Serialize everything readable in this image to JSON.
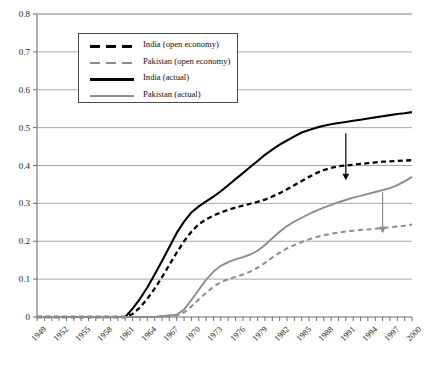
{
  "chart_data": {
    "type": "line",
    "title": "",
    "xlabel": "",
    "ylabel": "",
    "xlim": [
      1949,
      2000
    ],
    "ylim": [
      0,
      0.8
    ],
    "grid": "horizontal",
    "legend_position": "top-left",
    "ytick_labels": [
      "0",
      "0.1",
      "0.2",
      "0.3",
      "0.4",
      "0.5",
      "0.6",
      "0.7",
      "0.8"
    ],
    "ytick_values": [
      0,
      0.1,
      0.2,
      0.3,
      0.4,
      0.5,
      0.6,
      0.7,
      0.8
    ],
    "xtick_labels": [
      "1949",
      "1952",
      "1955",
      "1958",
      "1961",
      "1964",
      "1967",
      "1970",
      "1973",
      "1976",
      "1979",
      "1982",
      "1985",
      "1988",
      "1991",
      "1994",
      "1997",
      "2000"
    ],
    "xtick_values": [
      1949,
      1952,
      1955,
      1958,
      1961,
      1964,
      1967,
      1970,
      1973,
      1976,
      1979,
      1982,
      1985,
      1988,
      1991,
      1994,
      1997,
      2000
    ],
    "x": [
      1949,
      1950,
      1951,
      1952,
      1953,
      1954,
      1955,
      1956,
      1957,
      1958,
      1959,
      1960,
      1961,
      1962,
      1963,
      1964,
      1965,
      1966,
      1967,
      1968,
      1969,
      1970,
      1971,
      1972,
      1973,
      1974,
      1975,
      1976,
      1977,
      1978,
      1979,
      1980,
      1981,
      1982,
      1983,
      1984,
      1985,
      1986,
      1987,
      1988,
      1989,
      1990,
      1991,
      1992,
      1993,
      1994,
      1995,
      1996,
      1997,
      1998,
      1999,
      2000
    ],
    "series": [
      {
        "name": "India (actual)",
        "style": "solid",
        "color": "#000000",
        "values": [
          0,
          0,
          0,
          0,
          0,
          0,
          0,
          0,
          0,
          0,
          0,
          0,
          0,
          0.022,
          0.048,
          0.078,
          0.112,
          0.148,
          0.185,
          0.222,
          0.252,
          0.276,
          0.292,
          0.305,
          0.318,
          0.332,
          0.348,
          0.364,
          0.38,
          0.396,
          0.412,
          0.428,
          0.442,
          0.455,
          0.466,
          0.477,
          0.487,
          0.494,
          0.5,
          0.505,
          0.509,
          0.512,
          0.515,
          0.518,
          0.521,
          0.524,
          0.527,
          0.53,
          0.533,
          0.536,
          0.538,
          0.541
        ]
      },
      {
        "name": "India (open economy)",
        "style": "dashed",
        "color": "#000000",
        "values": [
          0,
          0,
          0,
          0,
          0,
          0,
          0,
          0,
          0,
          0,
          0,
          0,
          0,
          0.008,
          0.025,
          0.048,
          0.075,
          0.105,
          0.138,
          0.17,
          0.2,
          0.225,
          0.245,
          0.258,
          0.268,
          0.276,
          0.283,
          0.289,
          0.294,
          0.299,
          0.304,
          0.31,
          0.318,
          0.327,
          0.337,
          0.348,
          0.359,
          0.37,
          0.38,
          0.388,
          0.394,
          0.398,
          0.4,
          0.402,
          0.404,
          0.406,
          0.408,
          0.41,
          0.411,
          0.412,
          0.413,
          0.414
        ]
      },
      {
        "name": "Pakistan (actual)",
        "style": "solid",
        "color": "#8c8c8c",
        "values": [
          0,
          0,
          0,
          0,
          0,
          0,
          0,
          0,
          0,
          0,
          0,
          0,
          0,
          0,
          0,
          0,
          0,
          0.002,
          0.004,
          0.006,
          0.02,
          0.045,
          0.072,
          0.098,
          0.12,
          0.135,
          0.145,
          0.152,
          0.158,
          0.165,
          0.175,
          0.19,
          0.208,
          0.225,
          0.24,
          0.252,
          0.262,
          0.272,
          0.281,
          0.289,
          0.296,
          0.303,
          0.309,
          0.315,
          0.32,
          0.325,
          0.33,
          0.335,
          0.34,
          0.348,
          0.358,
          0.37
        ]
      },
      {
        "name": "Pakistan (open economy)",
        "style": "dashed",
        "color": "#8c8c8c",
        "values": [
          0,
          0,
          0,
          0,
          0,
          0,
          0,
          0,
          0,
          0,
          0,
          0,
          0,
          0,
          0,
          0,
          0,
          0.001,
          0.002,
          0.004,
          0.012,
          0.028,
          0.046,
          0.064,
          0.08,
          0.092,
          0.1,
          0.106,
          0.112,
          0.12,
          0.13,
          0.143,
          0.157,
          0.17,
          0.181,
          0.19,
          0.198,
          0.205,
          0.211,
          0.216,
          0.22,
          0.223,
          0.226,
          0.228,
          0.23,
          0.231,
          0.233,
          0.235,
          0.237,
          0.239,
          0.241,
          0.244
        ]
      }
    ],
    "annotations": [
      {
        "name": "india-gap-arrow",
        "color": "#000000",
        "x": 1991,
        "y_from": 0.485,
        "y_to": 0.365
      },
      {
        "name": "pakistan-gap-arrow",
        "color": "#8c8c8c",
        "x": 1996,
        "y_from": 0.33,
        "y_to": 0.225
      }
    ]
  },
  "legend": {
    "entries": [
      {
        "label": "India (open economy)",
        "style": "dashed",
        "color": "#000000"
      },
      {
        "label": "Pakistan (open economy)",
        "style": "dashed",
        "color": "#8c8c8c"
      },
      {
        "label": "India (actual)",
        "style": "solid",
        "color": "#000000"
      },
      {
        "label": "Pakistan (actual)",
        "style": "solid",
        "color": "#8c8c8c"
      }
    ]
  }
}
